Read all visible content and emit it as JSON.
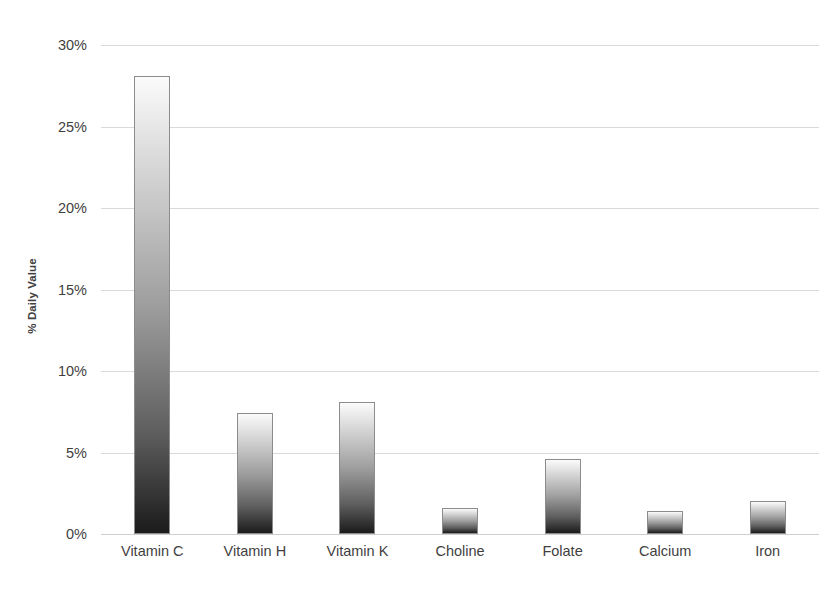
{
  "chart_data": {
    "type": "bar",
    "title": "",
    "subtitle": "",
    "xlabel": "",
    "ylabel": "% Daily Value",
    "categories": [
      "Vitamin C",
      "Vitamin H",
      "Vitamin K",
      "Choline",
      "Folate",
      "Calcium",
      "Iron"
    ],
    "values": [
      28.1,
      7.4,
      8.1,
      1.6,
      4.6,
      1.4,
      2.0
    ],
    "ylim": [
      0,
      30
    ],
    "ytick_labels": [
      "0%",
      "5%",
      "10%",
      "15%",
      "20%",
      "25%",
      "30%"
    ],
    "ytick_values": [
      0,
      5,
      10,
      15,
      20,
      25,
      30
    ],
    "grid": true,
    "legend": false,
    "legend_position": "none",
    "value_format": "percent",
    "bar_style": {
      "gradient_top": "#fbfbfb",
      "gradient_bottom": "#1b1b1b",
      "border_color": "#8c8c8c"
    },
    "axis_style": {
      "gridline_color": "#d9d9d9",
      "baseline_color": "#cfcfcf",
      "text_color": "#3f3f3f",
      "background": "#ffffff"
    }
  }
}
